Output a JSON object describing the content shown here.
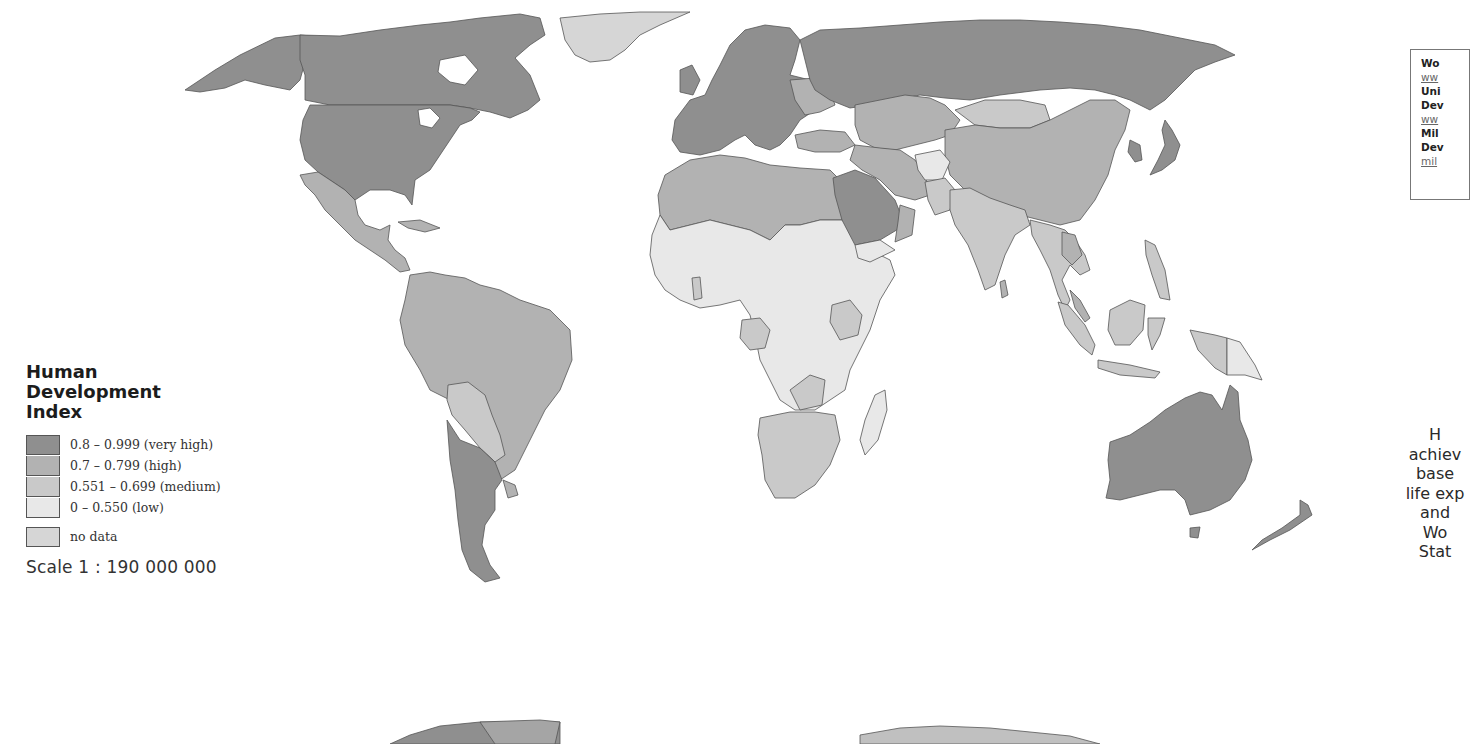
{
  "map": {
    "title": "Human Development Index",
    "title_lines": [
      "Human",
      "Development",
      "Index"
    ],
    "scale": "Scale 1 : 190 000 000",
    "colors": {
      "very_high": "#8f8f8f",
      "high": "#b2b2b2",
      "medium": "#c9c9c9",
      "low": "#e8e8e8",
      "no_data": "#d6d6d6",
      "border": "#555555",
      "ocean": "#ffffff"
    }
  },
  "legend": {
    "items": [
      {
        "label": "0.8 – 0.999 (very high)",
        "color": "#8f8f8f"
      },
      {
        "label": "0.7 – 0.799 (high)",
        "color": "#b2b2b2"
      },
      {
        "label": "0.551 – 0.699 (medium)",
        "color": "#c9c9c9"
      },
      {
        "label": "0 – 0.550 (low)",
        "color": "#e8e8e8"
      }
    ],
    "no_data": {
      "label": "no data",
      "color": "#d6d6d6"
    }
  },
  "sources_box": {
    "lines": [
      {
        "text": "Wo",
        "type": "title"
      },
      {
        "text": "ww",
        "type": "link"
      },
      {
        "text": "Uni",
        "type": "title"
      },
      {
        "text": "Dev",
        "type": "title"
      },
      {
        "text": "ww",
        "type": "link"
      },
      {
        "text": "Mil",
        "type": "title"
      },
      {
        "text": "Dev",
        "type": "title"
      },
      {
        "text": "mil",
        "type": "link"
      }
    ]
  },
  "caption": {
    "lines": [
      "H",
      "achiev",
      "base",
      "life exp",
      "and",
      "Wo",
      "Stat"
    ]
  },
  "regions": [
    {
      "name": "North America (USA, Canada)",
      "tier": "very_high"
    },
    {
      "name": "Greenland",
      "tier": "no_data"
    },
    {
      "name": "Mexico & Central America",
      "tier": "high"
    },
    {
      "name": "South America (north)",
      "tier": "high"
    },
    {
      "name": "Bolivia / Paraguay",
      "tier": "medium"
    },
    {
      "name": "Argentina / Chile",
      "tier": "very_high"
    },
    {
      "name": "Western Europe",
      "tier": "very_high"
    },
    {
      "name": "Russia",
      "tier": "very_high"
    },
    {
      "name": "Central Asia / Kazakhstan",
      "tier": "high"
    },
    {
      "name": "China",
      "tier": "high"
    },
    {
      "name": "Mongolia",
      "tier": "medium"
    },
    {
      "name": "North Africa",
      "tier": "high"
    },
    {
      "name": "Sub-Saharan Africa",
      "tier": "low"
    },
    {
      "name": "Southern Africa",
      "tier": "medium"
    },
    {
      "name": "Saudi Arabia",
      "tier": "very_high"
    },
    {
      "name": "Iran / Middle East",
      "tier": "high"
    },
    {
      "name": "India / South Asia",
      "tier": "medium"
    },
    {
      "name": "Southeast Asia",
      "tier": "medium"
    },
    {
      "name": "Japan",
      "tier": "very_high"
    },
    {
      "name": "Australia",
      "tier": "very_high"
    },
    {
      "name": "New Zealand",
      "tier": "very_high"
    },
    {
      "name": "Madagascar",
      "tier": "low"
    },
    {
      "name": "Papua New Guinea",
      "tier": "low"
    }
  ]
}
